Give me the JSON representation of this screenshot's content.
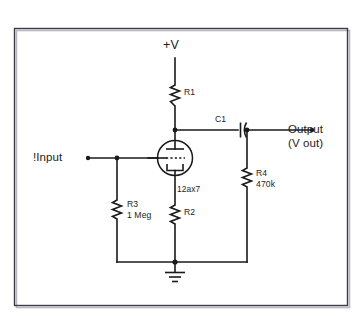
{
  "diagram": {
    "frame_color": "#3a3a44",
    "wire_color": "#1a1a1a",
    "background": "#ffffff"
  },
  "nets": {
    "supply_label": "+V",
    "input_label": "!Input",
    "output_label": "Output",
    "output_sublabel": "(V out)"
  },
  "tube": {
    "designation": "12ax7",
    "type": "triode",
    "electrodes": [
      "plate",
      "grid",
      "cathode"
    ]
  },
  "components": [
    {
      "ref": "R1",
      "kind": "resistor",
      "value": "",
      "label_lines": [
        "R1"
      ]
    },
    {
      "ref": "R2",
      "kind": "resistor",
      "value": "",
      "label_lines": [
        "R2"
      ]
    },
    {
      "ref": "R3",
      "kind": "resistor",
      "value": "1 Meg",
      "label_lines": [
        "R3",
        "1 Meg"
      ]
    },
    {
      "ref": "R4",
      "kind": "resistor",
      "value": "470k",
      "label_lines": [
        "R4",
        "470k"
      ]
    },
    {
      "ref": "C1",
      "kind": "capacitor",
      "value": "",
      "label_lines": [
        "C1"
      ]
    }
  ],
  "symbols": {
    "ground": "ground-symbol",
    "junction": "junction-dot",
    "terminal": "terminal-dot"
  }
}
